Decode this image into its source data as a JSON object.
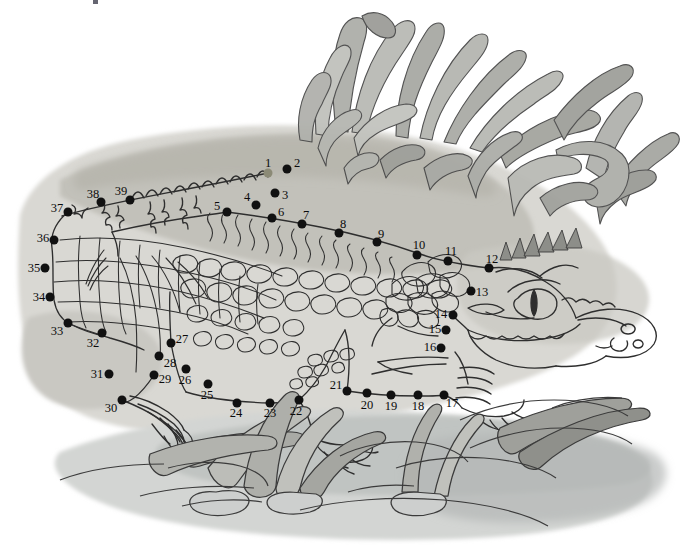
{
  "puzzle": {
    "type": "connect-the-dots",
    "subject": "crocodile",
    "scene": "A watercolour line-art crocodile lying on a sandy bank beside water, with tall grass tufts behind and reeds growing in the water in front.",
    "dot_count": 39,
    "start_dot": 1,
    "palette": {
      "paper": "#ffffff",
      "ink": "#2b2b2b",
      "dot": "#111111",
      "start_dot": "#8b8a76",
      "sand_light": "#dcdbd6",
      "sand_mid": "#c6c5bf",
      "sand_dark": "#b0afa8",
      "water": "#cfd2d1",
      "grass_light": "#c3c4c0",
      "grass_mid": "#a3a59f",
      "grass_dark": "#8a8c86"
    },
    "dots": [
      {
        "n": "1",
        "x": 268,
        "y": 173,
        "lx": 268,
        "ly": 163,
        "start": true
      },
      {
        "n": "2",
        "x": 287,
        "y": 169,
        "lx": 297,
        "ly": 163
      },
      {
        "n": "3",
        "x": 275,
        "y": 193,
        "lx": 285,
        "ly": 195
      },
      {
        "n": "4",
        "x": 256,
        "y": 205,
        "lx": 247,
        "ly": 197
      },
      {
        "n": "5",
        "x": 227,
        "y": 212,
        "lx": 217,
        "ly": 206
      },
      {
        "n": "6",
        "x": 272,
        "y": 218,
        "lx": 281,
        "ly": 212
      },
      {
        "n": "7",
        "x": 302,
        "y": 224,
        "lx": 306,
        "ly": 215
      },
      {
        "n": "8",
        "x": 339,
        "y": 233,
        "lx": 343,
        "ly": 224
      },
      {
        "n": "9",
        "x": 377,
        "y": 242,
        "lx": 381,
        "ly": 234
      },
      {
        "n": "10",
        "x": 417,
        "y": 255,
        "lx": 419,
        "ly": 245
      },
      {
        "n": "11",
        "x": 448,
        "y": 261,
        "lx": 451,
        "ly": 251
      },
      {
        "n": "12",
        "x": 489,
        "y": 268,
        "lx": 492,
        "ly": 259
      },
      {
        "n": "13",
        "x": 471,
        "y": 291,
        "lx": 482,
        "ly": 292
      },
      {
        "n": "14",
        "x": 453,
        "y": 315,
        "lx": 441,
        "ly": 314
      },
      {
        "n": "15",
        "x": 446,
        "y": 330,
        "lx": 435,
        "ly": 329
      },
      {
        "n": "16",
        "x": 441,
        "y": 348,
        "lx": 430,
        "ly": 347
      },
      {
        "n": "17",
        "x": 444,
        "y": 395,
        "lx": 452,
        "ly": 403
      },
      {
        "n": "18",
        "x": 418,
        "y": 395,
        "lx": 418,
        "ly": 406
      },
      {
        "n": "19",
        "x": 391,
        "y": 395,
        "lx": 391,
        "ly": 406
      },
      {
        "n": "20",
        "x": 367,
        "y": 393,
        "lx": 367,
        "ly": 405
      },
      {
        "n": "21",
        "x": 347,
        "y": 391,
        "lx": 336,
        "ly": 385
      },
      {
        "n": "22",
        "x": 299,
        "y": 400,
        "lx": 296,
        "ly": 411
      },
      {
        "n": "23",
        "x": 270,
        "y": 403,
        "lx": 270,
        "ly": 413
      },
      {
        "n": "24",
        "x": 237,
        "y": 403,
        "lx": 236,
        "ly": 413
      },
      {
        "n": "25",
        "x": 208,
        "y": 384,
        "lx": 207,
        "ly": 395
      },
      {
        "n": "26",
        "x": 186,
        "y": 369,
        "lx": 185,
        "ly": 380
      },
      {
        "n": "27",
        "x": 171,
        "y": 343,
        "lx": 182,
        "ly": 339
      },
      {
        "n": "28",
        "x": 159,
        "y": 356,
        "lx": 170,
        "ly": 363
      },
      {
        "n": "29",
        "x": 154,
        "y": 375,
        "lx": 165,
        "ly": 379
      },
      {
        "n": "30",
        "x": 122,
        "y": 400,
        "lx": 111,
        "ly": 408
      },
      {
        "n": "31",
        "x": 109,
        "y": 374,
        "lx": 97,
        "ly": 374
      },
      {
        "n": "32",
        "x": 102,
        "y": 333,
        "lx": 93,
        "ly": 343
      },
      {
        "n": "33",
        "x": 68,
        "y": 323,
        "lx": 57,
        "ly": 331
      },
      {
        "n": "34",
        "x": 50,
        "y": 297,
        "lx": 39,
        "ly": 297
      },
      {
        "n": "35",
        "x": 45,
        "y": 268,
        "lx": 34,
        "ly": 268
      },
      {
        "n": "36",
        "x": 54,
        "y": 240,
        "lx": 43,
        "ly": 238
      },
      {
        "n": "37",
        "x": 68,
        "y": 212,
        "lx": 57,
        "ly": 208
      },
      {
        "n": "38",
        "x": 101,
        "y": 202,
        "lx": 93,
        "ly": 194
      },
      {
        "n": "39",
        "x": 130,
        "y": 200,
        "lx": 121,
        "ly": 191
      }
    ]
  }
}
